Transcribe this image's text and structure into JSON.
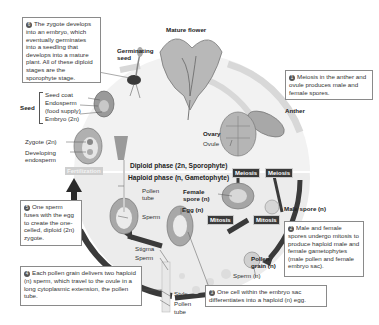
{
  "diagram": {
    "colors": {
      "background": "#ffffff",
      "cycle_fill": "#e6e6e6",
      "arrow_dark": "#3a3a3a",
      "arrow_light": "#d4d4d4",
      "tag_dark": "#3a3a3a",
      "box_border": "#8a8a8a"
    },
    "phases": {
      "diploid": "Diploid phase (2n, Sporophyte)",
      "haploid": "Haploid phase (n, Gametophyte)"
    },
    "process_tags": {
      "meiosis_female": "Meiosis",
      "meiosis_male": "Meiosis",
      "mitosis_female": "Mitosis",
      "mitosis_male": "Mitosis",
      "fertilization": "Fertilization"
    },
    "stage_labels": {
      "mature_flower": "Mature flower",
      "germinating_seed": "Germinating seed",
      "anther": "Anther",
      "ovary": "Ovary",
      "ovule": "Ovule",
      "seed": "Seed",
      "seed_coat": "Seed coat",
      "endosperm": "Endosperm",
      "food_supply": "(food supply)",
      "embryo": "Embryo (2n)",
      "zygote": "Zygote (2n)",
      "developing": "Developing",
      "endosperm2": "endosperm",
      "pollen_tube_top_1": "Pollen",
      "pollen_tube_top_2": "tube",
      "sperm_mid": "Sperm",
      "female_spore_1": "Female",
      "female_spore_2": "spore (n)",
      "egg": "Egg (n)",
      "male_spore": "Male spore (n)",
      "pollen_grain_1": "Pollen",
      "pollen_grain_2": "grain (n)",
      "sperm_n": "Sperm (n)",
      "stigma": "Stigma",
      "sperm_bottom": "Sperm",
      "style": "Style",
      "pollen_tube_bottom_1": "Pollen",
      "pollen_tube_bottom_2": "tube"
    },
    "steps": [
      {
        "number": "1",
        "text": "Meiosis in the anther and ovule produces male and female spores."
      },
      {
        "number": "2",
        "text": "Male and female spores undergo mitosis to produce haploid male and female gametophytes (male pollen and female embryo sac)."
      },
      {
        "number": "3",
        "text": "One cell within the embryo sac differentiates into a haploid (n) egg."
      },
      {
        "number": "4",
        "text": "Each pollen grain delivers two haploid (n) sperm, which travel to the ovule in a long cytoplasmic extension, the pollen tube."
      },
      {
        "number": "5",
        "text": "One sperm fuses with the egg to create the one-celled, diploid (2n) zygote."
      },
      {
        "number": "6",
        "text": "The zygote develops into an embryo, which eventually germinates into a seedling that develops into a mature plant. All of these diploid stages are the sporophyte stage."
      }
    ]
  }
}
